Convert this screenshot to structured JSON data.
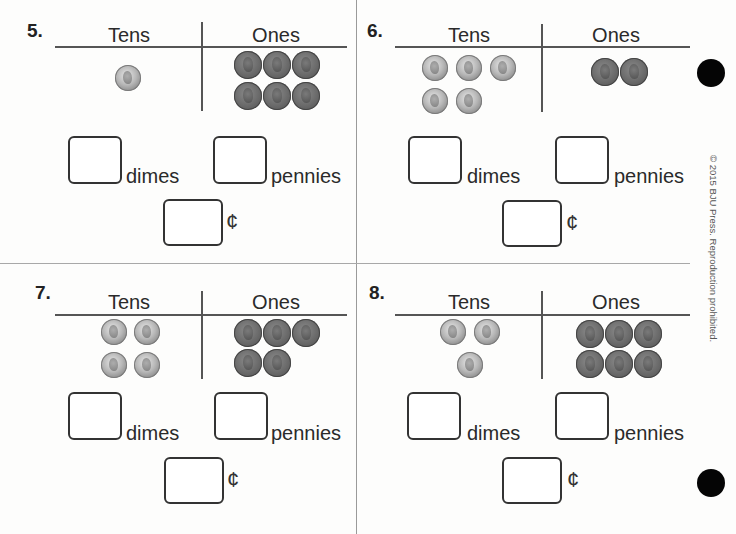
{
  "worksheet": {
    "copyright": "© 2015 BJU Press. Reproduction prohibited.",
    "column_headers": {
      "tens": "Tens",
      "ones": "Ones"
    },
    "labels": {
      "dimes": "dimes",
      "pennies": "pennies",
      "cents": "¢"
    },
    "problems": [
      {
        "number": "5.",
        "dimes": 1,
        "pennies": 6,
        "answer_dimes": "",
        "answer_pennies": "",
        "answer_cents": ""
      },
      {
        "number": "6.",
        "dimes": 5,
        "pennies": 2,
        "answer_dimes": "",
        "answer_pennies": "",
        "answer_cents": ""
      },
      {
        "number": "7.",
        "dimes": 4,
        "pennies": 5,
        "answer_dimes": "",
        "answer_pennies": "",
        "answer_cents": ""
      },
      {
        "number": "8.",
        "dimes": 3,
        "pennies": 6,
        "answer_dimes": "",
        "answer_pennies": "",
        "answer_cents": ""
      }
    ],
    "icons": {
      "dime": "dime-coin-icon",
      "penny": "penny-coin-icon",
      "hole_punch": "hole-punch-dot"
    }
  }
}
